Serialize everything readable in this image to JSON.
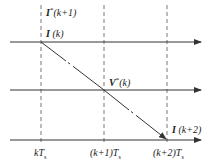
{
  "diagram": {
    "type": "timing-diagram",
    "stroke_color": "#333333",
    "time_axis": {
      "ticks": [
        {
          "label_prefix": "k",
          "label_var": "T",
          "label_sub": "s",
          "full": "kTs"
        },
        {
          "label_prefix": "(k+1)",
          "label_var": "T",
          "label_sub": "s",
          "full": "(k+1)Ts"
        },
        {
          "label_prefix": "(k+2)",
          "label_var": "T",
          "label_sub": "s",
          "full": "(k+2)Ts"
        }
      ]
    },
    "labels": {
      "i_ref_next": {
        "symbol": "I",
        "sup": "*",
        "arg": "(k+1)"
      },
      "i_k": {
        "symbol": "I",
        "arg": " (k)"
      },
      "v_ref_k": {
        "symbol": "V",
        "sup": "*",
        "arg": "(k)"
      },
      "i_k2": {
        "symbol": "I",
        "arg": " (k+2)"
      }
    },
    "horizontal_arrows": 3,
    "vertical_dashed_lines": 3,
    "diagonal_segments": [
      {
        "from": "I(k)",
        "to": "V*(k)"
      },
      {
        "from": "V*(k)",
        "to": "I(k+2)"
      }
    ]
  }
}
